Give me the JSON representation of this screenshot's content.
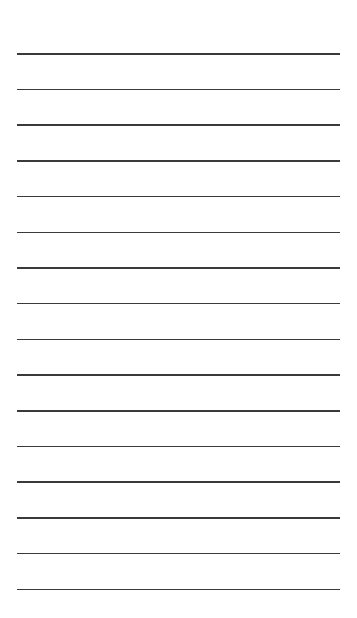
{
  "page": {
    "type": "lined-paper",
    "background_color": "#ffffff",
    "line_color": "#3a3a3a",
    "line_count": 16,
    "first_line_y": 53,
    "line_spacing": 35.7,
    "line_left": 17,
    "line_right": 340
  }
}
